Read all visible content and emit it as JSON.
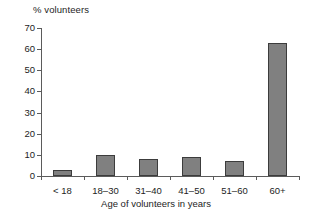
{
  "chart_data": {
    "type": "bar",
    "title": "",
    "categories": [
      "< 18",
      "18–30",
      "31–40",
      "41–50",
      "51–60",
      "60+"
    ],
    "values": [
      3,
      10,
      8,
      9,
      7,
      63
    ],
    "xlabel": "Age of volunteers in years",
    "ylabel": "% volunteers",
    "ylim": [
      0,
      70
    ],
    "ytick_labels": [
      "0",
      "10",
      "20",
      "30",
      "40",
      "50",
      "60",
      "70"
    ],
    "ytick_values": [
      0,
      10,
      20,
      30,
      40,
      50,
      60,
      70
    ],
    "grid": false,
    "legend": false,
    "bar_color": "#808080",
    "bar_edge_color": "#3c3c3c",
    "axis_color": "#5b5b5b",
    "text_color": "#1d1d1d",
    "background": "#ffffff"
  }
}
